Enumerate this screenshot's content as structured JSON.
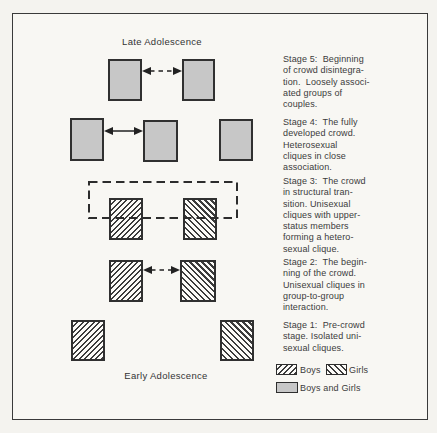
{
  "titles": {
    "top": "Late Adolescence",
    "bottom": "Early Adolescence"
  },
  "stages": [
    {
      "name": "Stage 5",
      "text": "Stage 5:  Beginning\nof crowd disintegra-\ntion.  Loosely associ-\nated groups of\ncouples.",
      "diagram": "two boys-and-girls boxes linked by a dashed double-headed arrow"
    },
    {
      "name": "Stage 4",
      "text": "Stage 4:  The fully\ndeveloped crowd.\nHeterosexual\ncliques in close\nassociation.",
      "diagram": "three boys-and-girls boxes; first two linked by a solid double-headed arrow"
    },
    {
      "name": "Stage 3",
      "text": "Stage 3:  The crowd\nin structural tran-\nsition. Unisexual\ncliques with upper-\nstatus members\nforming a hetero-\nsexual clique.",
      "diagram": "boys box and girls box overlapped across their tops by a dashed rectangle"
    },
    {
      "name": "Stage 2",
      "text": "Stage 2:  The begin-\nning of the crowd.\nUnisexual cliques in\ngroup-to-group\ninteraction.",
      "diagram": "boys box and girls box linked by a dashed double-headed arrow"
    },
    {
      "name": "Stage 1",
      "text": "Stage 1:  Pre-crowd\nstage. Isolated uni-\nsexual cliques.",
      "diagram": "isolated boys box and girls box"
    }
  ],
  "legend": {
    "boys": "Boys",
    "girls": "Girls",
    "boys_and_girls": "Boys and Girls"
  },
  "colors": {
    "mixed_fill": "#c7c7c7",
    "hatch_line": "#3c3c3c",
    "outline": "#303030",
    "text": "#3b3b3b",
    "page_background": "#f4f3ef"
  }
}
